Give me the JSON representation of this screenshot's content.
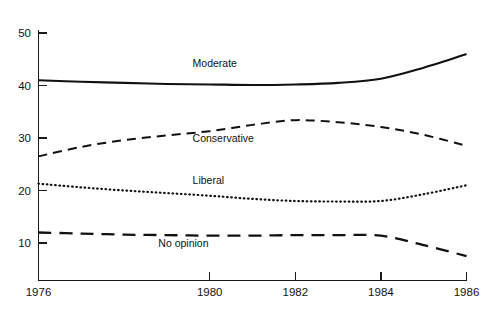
{
  "chart_data": {
    "type": "line",
    "title": "",
    "xlabel": "",
    "ylabel": "",
    "xlim": [
      1976,
      1986
    ],
    "ylim": [
      0,
      50
    ],
    "grid": false,
    "legend_position": "inline-labels",
    "x_ticks": [
      "1976",
      "1980",
      "1982",
      "1984",
      "1986"
    ],
    "x_tick_values": [
      1976,
      1980,
      1982,
      1984,
      1986
    ],
    "y_ticks": [
      "10",
      "20",
      "30",
      "40",
      "50"
    ],
    "y_tick_values": [
      10,
      20,
      30,
      40,
      50
    ],
    "x": [
      1976,
      1977,
      1978,
      1979,
      1980,
      1981,
      1982,
      1983,
      1984,
      1985,
      1986
    ],
    "series": [
      {
        "name": "Moderate",
        "style": "solid",
        "label_x": 1979.6,
        "label_y": 43.6,
        "values": [
          41.0,
          40.7,
          40.5,
          40.3,
          40.2,
          40.1,
          40.2,
          40.5,
          41.3,
          43.4,
          46.0
        ]
      },
      {
        "name": "Conservative",
        "style": "dashed",
        "label_x": 1979.6,
        "label_y": 29.2,
        "values": [
          26.5,
          28.3,
          29.6,
          30.5,
          31.3,
          32.5,
          33.4,
          33.0,
          32.1,
          30.6,
          28.5
        ]
      },
      {
        "name": "Liberal",
        "style": "dotted",
        "label_x": 1979.6,
        "label_y": 21.3,
        "values": [
          21.3,
          20.6,
          20.0,
          19.5,
          19.0,
          18.4,
          18.0,
          17.9,
          18.0,
          19.3,
          21.0
        ]
      },
      {
        "name": "No opinion",
        "style": "long-dashed",
        "label_x": 1978.8,
        "label_y": 9.3,
        "values": [
          12.0,
          11.8,
          11.6,
          11.5,
          11.4,
          11.4,
          11.5,
          11.5,
          11.4,
          9.6,
          7.5
        ]
      }
    ]
  },
  "axis": {
    "y_axis_name": "percent-axis",
    "x_axis_name": "year-axis"
  }
}
